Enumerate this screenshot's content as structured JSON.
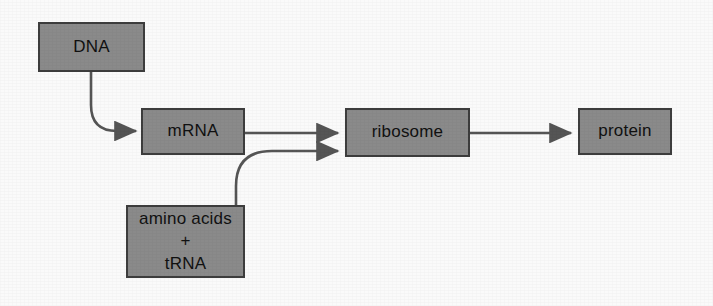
{
  "figure": {
    "background_color": "#fafafa",
    "node_fill_color": "#8a8a8a",
    "node_border_color": "#3d3d3d",
    "text_color": "#111111",
    "arrow_color": "#555555"
  },
  "nodes": [
    {
      "id": "dna",
      "label": "DNA",
      "lines": [
        "DNA"
      ],
      "x": 38,
      "y": 22,
      "w": 107,
      "h": 50
    },
    {
      "id": "mrna",
      "label": "mRNA",
      "lines": [
        "mRNA"
      ],
      "x": 141,
      "y": 108,
      "w": 104,
      "h": 47
    },
    {
      "id": "ribosome",
      "label": "ribosome",
      "lines": [
        "ribosome"
      ],
      "x": 345,
      "y": 108,
      "w": 125,
      "h": 49
    },
    {
      "id": "protein",
      "label": "protein",
      "lines": [
        "protein"
      ],
      "x": 578,
      "y": 108,
      "w": 94,
      "h": 47
    },
    {
      "id": "amino_acids",
      "label": "amino acids + tRNA",
      "lines": [
        "amino acids",
        "+",
        "tRNA"
      ],
      "x": 126,
      "y": 205,
      "w": 119,
      "h": 73
    }
  ],
  "edges": [
    {
      "id": "dna-to-mrna",
      "from": "dna",
      "to": "mrna",
      "style": "curved",
      "arrowhead": true
    },
    {
      "id": "mrna-to-ribosome",
      "from": "mrna",
      "to": "ribosome",
      "style": "straight",
      "arrowhead": true
    },
    {
      "id": "aminoacids-to-ribosome",
      "from": "amino_acids",
      "to": "ribosome",
      "style": "curved",
      "arrowhead": true
    },
    {
      "id": "ribosome-to-protein",
      "from": "ribosome",
      "to": "protein",
      "style": "straight",
      "arrowhead": true
    }
  ]
}
